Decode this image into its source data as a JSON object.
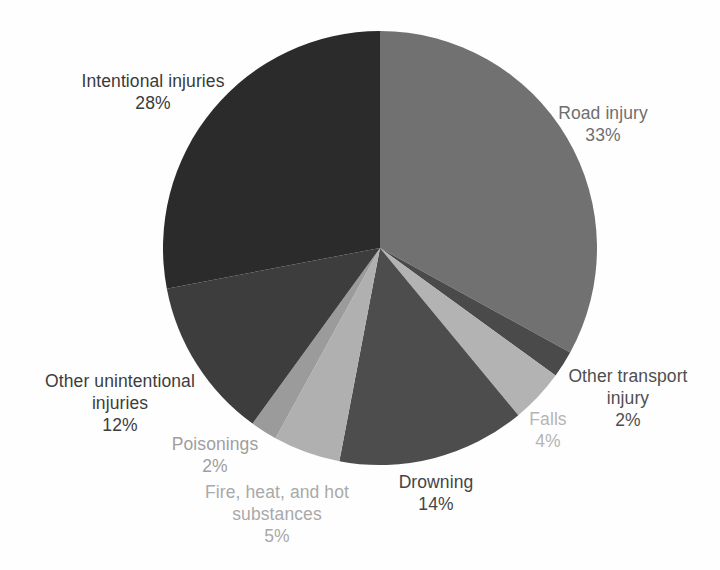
{
  "chart_data": {
    "type": "pie",
    "title": "",
    "legend": "none",
    "labels_position": "outside",
    "start_angle_deg": 0,
    "direction": "clockwise",
    "center": {
      "x": 380,
      "y": 248
    },
    "radius": 217,
    "background_color": "#fefefe",
    "categories": [
      "Road injury",
      "Other transport injury",
      "Falls",
      "Drowning",
      "Fire, heat, and hot substances",
      "Poisonings",
      "Other unintentional injuries",
      "Intentional injuries"
    ],
    "values": [
      33,
      2,
      4,
      14,
      5,
      2,
      12,
      28
    ],
    "slices": [
      {
        "name": "Road injury",
        "pct": 33,
        "pct_label": "33%",
        "color": "#717171",
        "label_color": "#6f6f6f"
      },
      {
        "name": "Other transport injury",
        "pct": 2,
        "pct_label": "2%",
        "color": "#4a4a4a",
        "label_color": "#4f4f4f"
      },
      {
        "name": "Falls",
        "pct": 4,
        "pct_label": "4%",
        "color": "#b3b3b3",
        "label_color": "#b5b5b5"
      },
      {
        "name": "Drowning",
        "pct": 14,
        "pct_label": "14%",
        "color": "#4d4d4d",
        "label_color": "#454545"
      },
      {
        "name": "Fire, heat, and hot substances",
        "pct": 5,
        "pct_label": "5%",
        "color": "#b0b0b0",
        "label_color": "#a9a9a9"
      },
      {
        "name": "Poisonings",
        "pct": 2,
        "pct_label": "2%",
        "color": "#9b9b9b",
        "label_color": "#9e9e9e"
      },
      {
        "name": "Other unintentional injuries",
        "pct": 12,
        "pct_label": "12%",
        "color": "#3d3d3d",
        "label_color": "#3d3d3d"
      },
      {
        "name": "Intentional injuries",
        "pct": 28,
        "pct_label": "28%",
        "color": "#2b2b2b",
        "label_color": "#3a3a3a"
      }
    ]
  }
}
